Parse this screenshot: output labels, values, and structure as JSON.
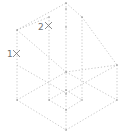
{
  "diagram": {
    "type": "isometric-wireframe",
    "line_color": "#b8b8b8",
    "label_color": "#707070",
    "points": [
      {
        "label": "1",
        "x": 15,
        "y": 54
      },
      {
        "label": "2",
        "x": 48,
        "y": 25
      }
    ]
  }
}
